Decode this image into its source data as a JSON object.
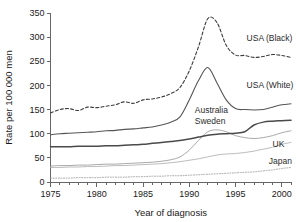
{
  "chart_data": {
    "type": "line",
    "title": "",
    "subtitle": "",
    "xlabel": "Year of diagnosis",
    "ylabel": "Rate per 100 000 men",
    "xlim": [
      1975,
      2001
    ],
    "ylim": [
      0,
      350
    ],
    "xticks": [
      1975,
      1980,
      1985,
      1990,
      1995,
      2000
    ],
    "xtick_labels": [
      "1975",
      "1980",
      "1985",
      "1990",
      "1995",
      "2000"
    ],
    "x_minor_ticks": [
      1976,
      1977,
      1978,
      1979,
      1981,
      1982,
      1983,
      1984,
      1986,
      1987,
      1988,
      1989,
      1991,
      1992,
      1993,
      1994,
      1996,
      1997,
      1998,
      1999,
      2001
    ],
    "yticks": [
      0,
      50,
      100,
      150,
      200,
      250,
      300,
      350
    ],
    "ytick_labels": [
      "0",
      "50",
      "100",
      "150",
      "200",
      "250",
      "300",
      "350"
    ],
    "grid": false,
    "legend_position": "inline-right-annotations",
    "x": [
      1975,
      1976,
      1977,
      1978,
      1979,
      1980,
      1981,
      1982,
      1983,
      1984,
      1985,
      1986,
      1987,
      1988,
      1989,
      1990,
      1991,
      1992,
      1993,
      1994,
      1995,
      1996,
      1997,
      1998,
      1999,
      2000,
      2001
    ],
    "series": [
      {
        "name": "USA (Black)",
        "style": "dashed",
        "color": "#3c3c3c",
        "label_x": 1996.2,
        "label_y": 293,
        "values": [
          143,
          150,
          152,
          148,
          155,
          154,
          157,
          160,
          166,
          163,
          170,
          172,
          176,
          183,
          196,
          230,
          280,
          338,
          330,
          283,
          263,
          262,
          258,
          260,
          264,
          262,
          258
        ]
      },
      {
        "name": "USA (White)",
        "style": "solid",
        "color": "#555555",
        "label_x": 1996.2,
        "label_y": 195,
        "values": [
          98,
          100,
          101,
          102,
          103,
          104,
          106,
          107,
          109,
          110,
          112,
          114,
          118,
          124,
          135,
          170,
          210,
          237,
          205,
          170,
          152,
          150,
          149,
          150,
          155,
          160,
          162
        ]
      },
      {
        "name": "Australia",
        "style": "solid-thin",
        "color": "#9a9a9a",
        "label_x": 1990.6,
        "label_y": 143,
        "values": [
          33,
          34,
          34,
          35,
          35,
          36,
          37,
          37,
          38,
          39,
          40,
          41,
          43,
          46,
          52,
          66,
          86,
          104,
          108,
          104,
          96,
          92,
          90,
          92,
          96,
          102,
          106
        ]
      },
      {
        "name": "Sweden",
        "style": "solid-thick",
        "color": "#4a4a4a",
        "label_x": 1990.6,
        "label_y": 120,
        "values": [
          73,
          73,
          73,
          74,
          74,
          74,
          75,
          75,
          76,
          77,
          78,
          80,
          82,
          84,
          86,
          89,
          93,
          97,
          99,
          100,
          101,
          104,
          118,
          124,
          126,
          127,
          128
        ]
      },
      {
        "name": "UK",
        "style": "solid-light",
        "color": "#b0b0b0",
        "label_x": 1999.0,
        "label_y": 72,
        "values": [
          30,
          30,
          31,
          31,
          32,
          32,
          33,
          34,
          34,
          35,
          36,
          37,
          38,
          40,
          42,
          45,
          48,
          52,
          56,
          58,
          59,
          61,
          64,
          68,
          72,
          78,
          82
        ]
      },
      {
        "name": "Japan",
        "style": "dotted",
        "color": "#9d9d9d",
        "label_x": 1998.6,
        "label_y": 38,
        "values": [
          8,
          8,
          8,
          9,
          9,
          9,
          10,
          10,
          10,
          11,
          11,
          12,
          12,
          13,
          13,
          14,
          15,
          16,
          17,
          18,
          19,
          20,
          21,
          23,
          25,
          28,
          30
        ]
      }
    ],
    "annotations": [
      {
        "text": "USA (Black)",
        "series": "USA (Black)"
      },
      {
        "text": "USA (White)",
        "series": "USA (White)"
      },
      {
        "text": "Australia",
        "series": "Australia"
      },
      {
        "text": "Sweden",
        "series": "Sweden"
      },
      {
        "text": "UK",
        "series": "UK"
      },
      {
        "text": "Japan",
        "series": "Japan"
      }
    ]
  }
}
